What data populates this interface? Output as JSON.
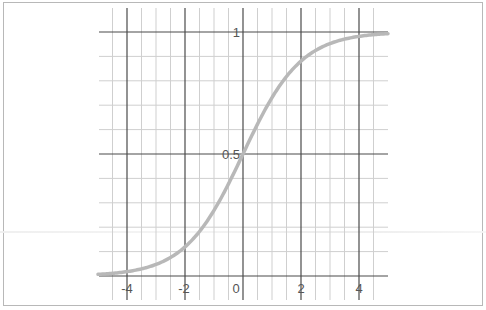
{
  "chart_data": {
    "type": "line",
    "title": "",
    "xlabel": "",
    "ylabel": "",
    "function": "sigmoid: y = 1 / (1 + e^(-x))",
    "xlim": [
      -5,
      5
    ],
    "ylim": [
      0,
      1.1
    ],
    "grid": true,
    "x_ticks": [
      -4,
      -2,
      0,
      2,
      4
    ],
    "x_tick_labels": [
      "-4",
      "-2",
      "0",
      "2",
      "4"
    ],
    "y_ticks": [
      0.5,
      1
    ],
    "y_tick_labels": [
      "0.5",
      "1"
    ],
    "minor_x_step": 0.5,
    "minor_y_step": 0.1,
    "series": [
      {
        "name": "sigmoid",
        "color": "#b8b8b8",
        "x": [
          -5,
          -4.5,
          -4,
          -3.5,
          -3,
          -2.5,
          -2,
          -1.5,
          -1,
          -0.5,
          0,
          0.5,
          1,
          1.5,
          2,
          2.5,
          3,
          3.5,
          4,
          4.5,
          5
        ],
        "y": [
          0.007,
          0.011,
          0.018,
          0.029,
          0.047,
          0.076,
          0.119,
          0.182,
          0.269,
          0.378,
          0.5,
          0.622,
          0.731,
          0.818,
          0.881,
          0.924,
          0.953,
          0.971,
          0.982,
          0.989,
          0.993
        ]
      }
    ],
    "legend": null
  },
  "labels": {
    "x": [
      "-4",
      "-2",
      "0",
      "2",
      "4"
    ],
    "y_one": "1",
    "y_half": "0.5"
  },
  "colors": {
    "major_grid": "#4a4a4a",
    "minor_grid": "#cfcfcf",
    "curve": "#b8b8b8",
    "frame": "#b8b8b8"
  }
}
